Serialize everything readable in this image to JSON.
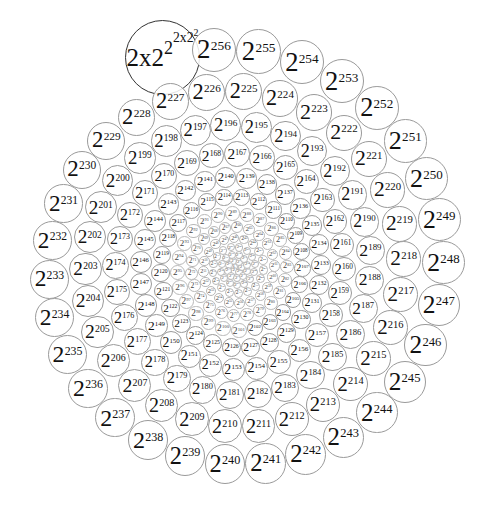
{
  "diagram": {
    "title": "",
    "base": "2",
    "one_label": "1",
    "exponents": [
      0,
      1,
      2,
      3,
      4,
      5,
      6,
      7,
      8,
      9,
      10,
      11,
      12,
      13,
      14,
      15,
      16,
      17,
      18,
      19,
      20,
      21,
      22,
      23,
      24,
      25,
      26,
      27,
      28,
      29,
      30,
      31,
      32,
      33,
      34,
      35,
      36,
      37,
      38,
      39,
      40,
      41,
      42,
      43,
      44,
      45,
      46,
      47,
      48,
      49,
      50,
      51,
      52,
      53,
      54,
      55,
      56,
      57,
      58,
      59,
      60,
      61,
      62,
      63,
      64,
      65,
      66,
      67,
      68,
      69,
      70,
      71,
      72,
      73,
      74,
      75,
      76,
      77,
      78,
      79,
      80,
      81,
      82,
      83,
      84,
      85,
      86,
      87,
      88,
      89,
      90,
      91,
      92,
      93,
      94,
      95,
      96,
      97,
      98,
      99,
      100,
      101,
      102,
      103,
      104,
      105,
      106,
      107,
      108,
      109,
      110,
      111,
      112,
      113,
      114,
      115,
      116,
      117,
      118,
      119,
      120,
      121,
      122,
      123,
      124,
      125,
      126,
      127,
      128,
      129,
      130,
      131,
      132,
      133,
      134,
      135,
      136,
      137,
      138,
      139,
      140,
      141,
      142,
      143,
      144,
      145,
      146,
      147,
      148,
      149,
      150,
      151,
      152,
      153,
      154,
      155,
      156,
      157,
      158,
      159,
      160,
      161,
      162,
      163,
      164,
      165,
      166,
      167,
      168,
      169,
      170,
      171,
      172,
      173,
      174,
      175,
      176,
      177,
      178,
      179,
      180,
      181,
      182,
      183,
      184,
      185,
      186,
      187,
      188,
      189,
      190,
      191,
      192,
      193,
      194,
      195,
      196,
      197,
      198,
      199,
      200,
      201,
      202,
      203,
      204,
      205,
      206,
      207,
      208,
      209,
      210,
      211,
      212,
      213,
      214,
      215,
      216,
      217,
      218,
      219,
      220,
      221,
      222,
      223,
      224,
      225,
      226,
      227,
      228,
      229,
      230,
      231,
      232,
      233,
      234,
      235,
      236,
      237,
      238,
      239,
      240,
      241,
      242,
      243,
      244,
      245,
      246,
      247,
      248,
      249,
      250,
      251,
      252,
      253,
      254,
      255,
      256
    ],
    "special": {
      "base": "2x2",
      "sup1": "2",
      "sup2": "2x2",
      "sup3": "2"
    },
    "colors": {
      "circle_stroke": "#9a9a9a",
      "special_stroke": "#333333",
      "text": "#111111",
      "background": "#ffffff"
    }
  }
}
